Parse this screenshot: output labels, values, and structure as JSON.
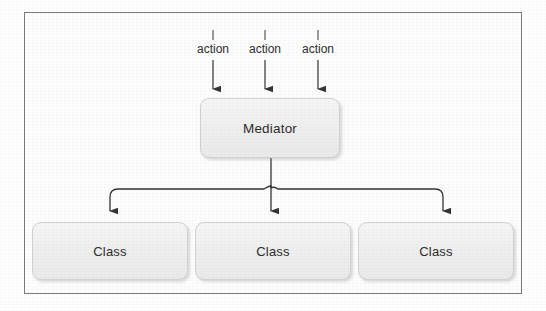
{
  "diagram": {
    "frame": {
      "border_color": "#7a7a7a",
      "background": "#ffffff"
    },
    "node_style": {
      "fill": "#f1f1f1",
      "border": "#d2d2d2",
      "text_color": "#2b2b2b"
    },
    "connector_color": "#3a3a3a",
    "inputs": [
      {
        "label": "action"
      },
      {
        "label": "action"
      },
      {
        "label": "action"
      }
    ],
    "mediator": {
      "label": "Mediator"
    },
    "classes": [
      {
        "label": "Class"
      },
      {
        "label": "Class"
      },
      {
        "label": "Class"
      }
    ]
  }
}
